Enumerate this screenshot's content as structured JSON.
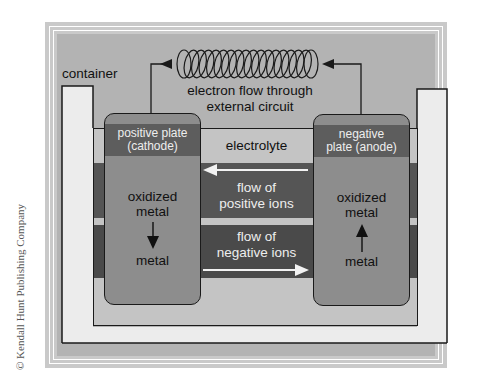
{
  "diagram": {
    "type": "electrochemical cell",
    "labels": {
      "container": "container",
      "electron_flow_line1": "electron flow through",
      "electron_flow_line2": "external circuit",
      "electrolyte": "electrolyte",
      "positive_flow_line1": "flow of",
      "positive_flow_line2": "positive ions",
      "negative_flow_line1": "flow of",
      "negative_flow_line2": "negative ions"
    },
    "cathode": {
      "title_line1": "positive plate",
      "title_line2": "(cathode)",
      "top_text_line1": "oxidized",
      "top_text_line2": "metal",
      "bottom_text": "metal",
      "arrow_direction": "down"
    },
    "anode": {
      "title_line1": "negative",
      "title_line2": "plate (anode)",
      "top_text_line1": "oxidized",
      "top_text_line2": "metal",
      "bottom_text": "metal",
      "arrow_direction": "up"
    },
    "external_circuit": {
      "component": "coil",
      "coil_loops": 18,
      "arrow_direction": "right-to-left"
    },
    "colors": {
      "panel": "#b3b3b3",
      "frame": "#c9c9c9",
      "container_wall": "#ececec",
      "electrolyte": "#c4c4c4",
      "ion_band": "#555555",
      "plate": "#8d8d8d",
      "plate_header": "#5d5d5d"
    }
  },
  "credit": "© Kendall Hunt Publishing Company"
}
